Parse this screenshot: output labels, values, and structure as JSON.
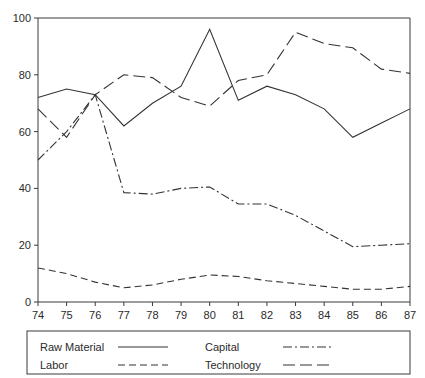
{
  "chart_data": {
    "type": "line",
    "title": "",
    "subtitle": "",
    "xlabel": "",
    "ylabel": "",
    "xlim": [
      74,
      87
    ],
    "ylim": [
      0,
      100
    ],
    "grid": false,
    "legend_position": "bottom",
    "categories": [
      "74",
      "75",
      "76",
      "77",
      "78",
      "79",
      "80",
      "81",
      "82",
      "83",
      "84",
      "85",
      "86",
      "87"
    ],
    "x": [
      74,
      75,
      76,
      77,
      78,
      79,
      80,
      81,
      82,
      83,
      84,
      85,
      86,
      87
    ],
    "yticks": [
      0,
      20,
      40,
      60,
      80,
      100
    ],
    "xticks": [
      74,
      75,
      76,
      77,
      78,
      79,
      80,
      81,
      82,
      83,
      84,
      85,
      86,
      87
    ],
    "series": [
      {
        "name": "Raw Material",
        "style": "solid",
        "dash": "none",
        "values": [
          72,
          75,
          73,
          62,
          70,
          76,
          96,
          71,
          76,
          73,
          68,
          58,
          63,
          68
        ]
      },
      {
        "name": "Labor",
        "style": "dashed",
        "dash": "7,4",
        "values": [
          12,
          10,
          7,
          5,
          6,
          8,
          9.5,
          9,
          7.5,
          6.5,
          5.5,
          4.5,
          4.5,
          5.5
        ]
      },
      {
        "name": "Capital",
        "style": "dash-dot",
        "dash": "9,3,2,3",
        "values": [
          50,
          60,
          73,
          38.5,
          38,
          40,
          40.5,
          34.5,
          34.5,
          30.5,
          25,
          19.5,
          20,
          20.5
        ]
      },
      {
        "name": "Technology",
        "style": "long-dash",
        "dash": "12,5",
        "values": [
          68,
          58,
          73,
          80,
          79,
          72,
          69,
          78,
          80,
          95,
          91,
          89.5,
          82,
          80.5
        ]
      }
    ]
  },
  "axes": {
    "y_tick_labels": [
      "0",
      "20",
      "40",
      "60",
      "80",
      "100"
    ],
    "x_tick_labels": [
      "74",
      "75",
      "76",
      "77",
      "78",
      "79",
      "80",
      "81",
      "82",
      "83",
      "84",
      "85",
      "86",
      "87"
    ]
  },
  "legend": {
    "entries": [
      {
        "label": "Raw Material",
        "style": "solid"
      },
      {
        "label": "Capital",
        "style": "dash-dot"
      },
      {
        "label": "Labor",
        "style": "dashed"
      },
      {
        "label": "Technology",
        "style": "long-dash"
      }
    ],
    "items": {
      "raw_material": "Raw Material",
      "capital": "Capital",
      "labor": "Labor",
      "technology": "Technology"
    }
  },
  "colors": {
    "line": "#333333",
    "axis": "#3a3a3a",
    "text": "#2b2b2b",
    "background": "#ffffff"
  }
}
